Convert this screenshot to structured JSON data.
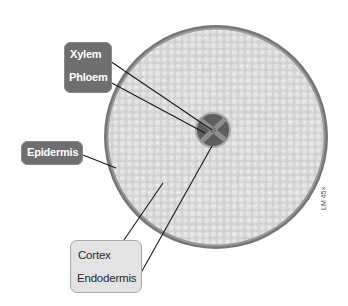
{
  "figure": {
    "magnification": "LM 45×",
    "colors": {
      "background": "#ffffff",
      "cortex_fill": "#d7d7d7",
      "epidermis_ring": "#7a7a7a",
      "stele_dark": "#5e5e5e",
      "xylem_cross": "#8c8c8c",
      "dark_label_bg": "#6f6f6f",
      "light_label_bg": "#e3e3e3",
      "leader_line": "#1a1a1a"
    }
  },
  "labels": {
    "xylem": "Xylem",
    "phloem": "Phloem",
    "epidermis": "Epidermis",
    "cortex": "Cortex",
    "endodermis": "Endodermis"
  }
}
